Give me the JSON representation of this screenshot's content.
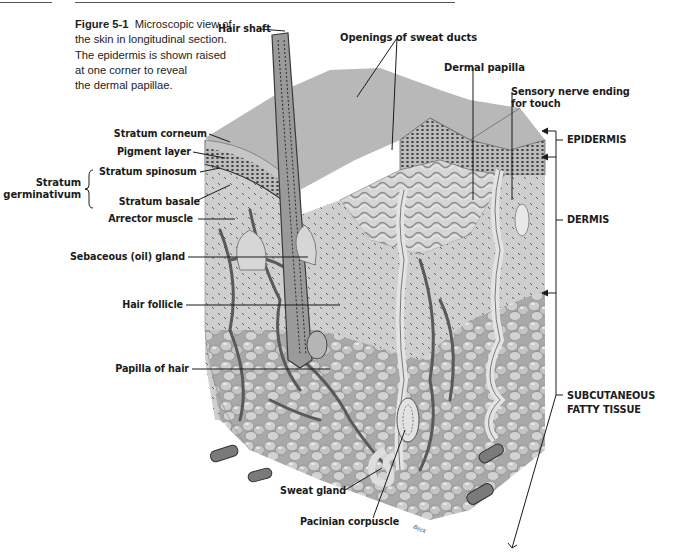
{
  "figure": {
    "number_label": "Figure 5-1",
    "caption_lines": [
      "Microscopic view of",
      "the skin in longitudinal section.",
      "The epidermis is shown raised",
      "at one corner to reveal",
      "the dermal papillae."
    ],
    "artist_signature": "Beck"
  },
  "labels": {
    "left": [
      {
        "id": "stratum-corneum",
        "text": "Stratum corneum"
      },
      {
        "id": "pigment-layer",
        "text": "Pigment layer"
      },
      {
        "id": "stratum-spinosum",
        "text": "Stratum spinosum"
      },
      {
        "id": "stratum-basale",
        "text": "Stratum basale"
      },
      {
        "id": "arrector-muscle",
        "text": "Arrector muscle"
      },
      {
        "id": "sebaceous-gland",
        "text": "Sebaceous (oil) gland"
      },
      {
        "id": "hair-follicle",
        "text": "Hair follicle"
      },
      {
        "id": "papilla-of-hair",
        "text": "Papilla of hair"
      }
    ],
    "group": {
      "line1": "Stratum",
      "line2": "germinativum"
    },
    "top": [
      {
        "id": "hair-shaft",
        "text": "Hair shaft"
      },
      {
        "id": "sweat-duct-openings",
        "text": "Openings of sweat ducts"
      },
      {
        "id": "dermal-papilla",
        "text": "Dermal papilla"
      },
      {
        "id": "sensory-nerve",
        "line1": "Sensory nerve ending",
        "line2": "for touch"
      }
    ],
    "bottom": [
      {
        "id": "sweat-gland",
        "text": "Sweat gland"
      },
      {
        "id": "pacinian-corpuscle",
        "text": "Pacinian corpuscle"
      }
    ],
    "regions": [
      {
        "id": "epidermis",
        "text": "EPIDERMIS"
      },
      {
        "id": "dermis",
        "text": "DERMIS"
      },
      {
        "id": "subcutaneous",
        "line1": "SUBCUTANEOUS",
        "line2": "FATTY TISSUE"
      }
    ]
  }
}
